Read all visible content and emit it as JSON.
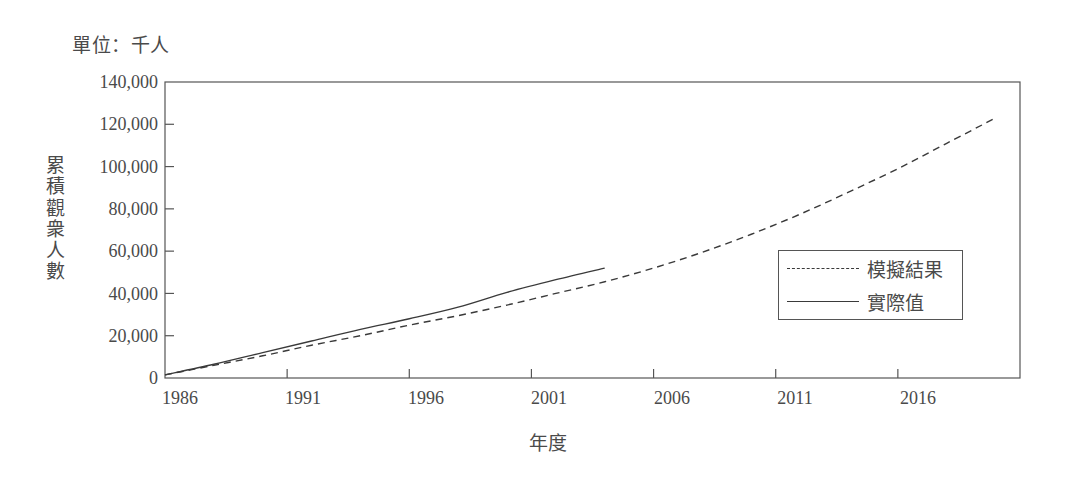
{
  "chart_data": {
    "type": "line",
    "title": "",
    "unit_note": "單位：千人",
    "xlabel": "年度",
    "ylabel": "累積觀衆人數",
    "xlim": [
      1986,
      2021
    ],
    "ylim": [
      0,
      140000
    ],
    "grid": false,
    "legend_position": "center-right",
    "y_ticks": [
      "140,000",
      "120,000",
      "100,000",
      "80,000",
      "60,000",
      "40,000",
      "20,000",
      "0"
    ],
    "y_tick_values": [
      140000,
      120000,
      100000,
      80000,
      60000,
      40000,
      20000,
      0
    ],
    "x_ticks": [
      "1986",
      "1991",
      "1996",
      "2001",
      "2006",
      "2011",
      "2016"
    ],
    "x_tick_values": [
      1986,
      1991,
      1996,
      2001,
      2006,
      2011,
      2016
    ],
    "series": [
      {
        "name": "模擬結果",
        "style": "dashed",
        "color": "#3a3a3a",
        "x": [
          1986,
          1988,
          1990,
          1992,
          1994,
          1996,
          1998,
          2000,
          2002,
          2004,
          2006,
          2008,
          2010,
          2012,
          2014,
          2016,
          2018,
          2020
        ],
        "values": [
          1500,
          6000,
          10500,
          15500,
          20000,
          25000,
          29500,
          34500,
          40000,
          45500,
          52000,
          59500,
          68000,
          77500,
          88000,
          99000,
          111000,
          123000
        ]
      },
      {
        "name": "實際值",
        "style": "solid",
        "color": "#3a3a3a",
        "x": [
          1986,
          1988,
          1990,
          1992,
          1994,
          1996,
          1998,
          2000,
          2002,
          2004
        ],
        "values": [
          1500,
          6500,
          12000,
          17500,
          23000,
          28000,
          33500,
          40500,
          46500,
          52000
        ]
      }
    ]
  },
  "legend": {
    "items": [
      {
        "label": "模擬結果",
        "style": "dashed"
      },
      {
        "label": "實際值",
        "style": "solid"
      }
    ]
  }
}
